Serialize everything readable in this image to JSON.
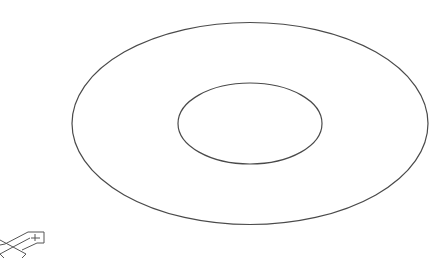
{
  "viewport": {
    "background": "#ffffff",
    "line_color": "#4a4a4a",
    "view": "isometric"
  },
  "drawing": {
    "shape": "annulus",
    "outer_ellipse": {
      "cx": 250,
      "cy": 123.5,
      "rx": 178,
      "ry": 101
    },
    "inner_ellipse": {
      "cx": 250,
      "cy": 123.5,
      "rx": 72,
      "ry": 40.5
    }
  },
  "ucs_icon": {
    "name": "ucs-icon",
    "type": "isometric",
    "color": "#555555"
  }
}
